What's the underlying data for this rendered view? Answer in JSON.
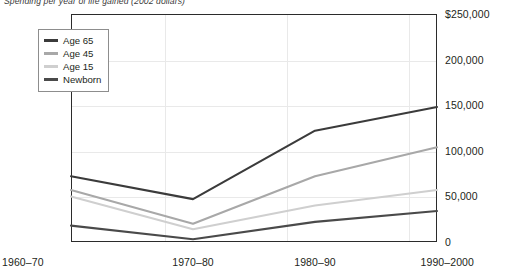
{
  "chart_data": {
    "type": "line",
    "title": "Spending per year of life gained (2002 dollars)",
    "xlabel": "",
    "ylabel": "",
    "categories": [
      "1960–70",
      "1970–80",
      "1980–90",
      "1990–2000"
    ],
    "ylim": [
      0,
      250000
    ],
    "yticks": [
      0,
      50000,
      100000,
      150000,
      200000,
      250000
    ],
    "ytick_labels": [
      "0",
      "50,000",
      "100,000",
      "150,000",
      "200,000",
      "$250,000"
    ],
    "grid": true,
    "legend_position": "top-left",
    "series": [
      {
        "name": "Age 65",
        "color": "#3b3b3b",
        "values": [
          72000,
          47000,
          122000,
          148000
        ]
      },
      {
        "name": "Age 45",
        "color": "#a8a8a8",
        "values": [
          57000,
          20000,
          72000,
          104000
        ]
      },
      {
        "name": "Age 15",
        "color": "#cfcfcf",
        "values": [
          50000,
          14000,
          40000,
          57000
        ]
      },
      {
        "name": "Newborn",
        "color": "#4a4a4a",
        "values": [
          18000,
          3000,
          22000,
          34000
        ]
      }
    ]
  },
  "axis": {
    "ytick_0": "0",
    "ytick_1": "50,000",
    "ytick_2": "100,000",
    "ytick_3": "150,000",
    "ytick_4": "200,000",
    "ytick_5": "$250,000",
    "xtick_0": "1960–70",
    "xtick_1": "1970–80",
    "xtick_2": "1980–90",
    "xtick_3": "1990–2000"
  },
  "legend": {
    "items": [
      {
        "label": "Age 65"
      },
      {
        "label": "Age 45"
      },
      {
        "label": "Age 15"
      },
      {
        "label": "Newborn"
      }
    ]
  }
}
